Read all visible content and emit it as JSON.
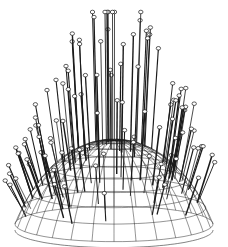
{
  "figure": {
    "stroke_color": "#1a1a1a",
    "pin_head_fill": "#ffffff",
    "background": "#ffffff",
    "dome": {
      "cx": 114,
      "rim_y": 200,
      "rx": 99,
      "height": 62,
      "bottom_y": 232,
      "meridians": 28,
      "parallels": 9
    },
    "pins": {
      "count": 110,
      "max_top_y": 12
    }
  },
  "caption": {
    "text": ""
  }
}
